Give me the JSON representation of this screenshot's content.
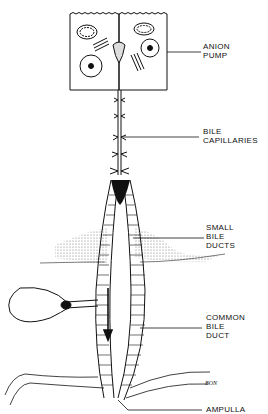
{
  "diagram": {
    "colors": {
      "ink": "#111111",
      "background": "#ffffff"
    },
    "labels": [
      {
        "id": "anion-pump",
        "lines": [
          "ANION",
          "PUMP"
        ]
      },
      {
        "id": "bile-capillaries",
        "lines": [
          "BILE",
          "CAPILLARIES"
        ]
      },
      {
        "id": "small-bile-ducts",
        "lines": [
          "SMALL",
          "BILE",
          "DUCTS"
        ]
      },
      {
        "id": "common-bile-duct",
        "lines": [
          "COMMON",
          "BILE",
          "DUCT"
        ]
      },
      {
        "id": "ampulla",
        "lines": [
          "AMPULLA"
        ]
      }
    ],
    "signature": "BON",
    "flow_arrow": "arrow-down"
  }
}
